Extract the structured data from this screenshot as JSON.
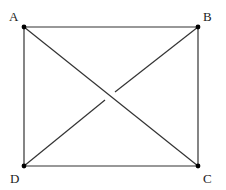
{
  "diagram": {
    "type": "geometry-rectangle-with-diagonals",
    "points": [
      {
        "id": "A",
        "label": "A",
        "x": 24,
        "y": 27
      },
      {
        "id": "B",
        "label": "B",
        "x": 198,
        "y": 27
      },
      {
        "id": "C",
        "label": "C",
        "x": 198,
        "y": 166
      },
      {
        "id": "D",
        "label": "D",
        "x": 24,
        "y": 166
      }
    ],
    "edges": [
      [
        "A",
        "B"
      ],
      [
        "B",
        "C"
      ],
      [
        "C",
        "D"
      ],
      [
        "D",
        "A"
      ],
      [
        "A",
        "C"
      ],
      [
        "B",
        "D"
      ]
    ]
  }
}
